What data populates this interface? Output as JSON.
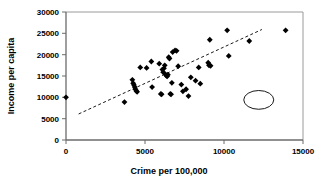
{
  "chart_data": {
    "type": "scatter",
    "title": "",
    "xlabel": "Crime per 100,000",
    "ylabel": "Income per capita",
    "xlim": [
      0,
      15000
    ],
    "ylim": [
      0,
      30000
    ],
    "xticks": [
      0,
      5000,
      10000,
      15000
    ],
    "yticks": [
      0,
      5000,
      10000,
      15000,
      20000,
      25000,
      30000
    ],
    "xtick_labels": [
      "0",
      "5000",
      "10000",
      "15000"
    ],
    "ytick_labels": [
      "0",
      "5000",
      "10000",
      "15000",
      "20000",
      "25000",
      "30000"
    ],
    "grid": false,
    "legend": null,
    "marker": "diamond",
    "marker_color": "#000000",
    "frame_color": "#808080",
    "points": [
      [
        0,
        10000
      ],
      [
        3700,
        8900
      ],
      [
        4200,
        14100
      ],
      [
        4250,
        13300
      ],
      [
        4300,
        12900
      ],
      [
        4350,
        12400
      ],
      [
        4400,
        11900
      ],
      [
        4450,
        11500
      ],
      [
        4500,
        11300
      ],
      [
        4700,
        17000
      ],
      [
        5100,
        16900
      ],
      [
        5400,
        18400
      ],
      [
        5450,
        12400
      ],
      [
        5900,
        17900
      ],
      [
        6000,
        10800
      ],
      [
        6050,
        10700
      ],
      [
        6100,
        16500
      ],
      [
        6150,
        15900
      ],
      [
        6200,
        16800
      ],
      [
        6250,
        17500
      ],
      [
        6300,
        15400
      ],
      [
        6350,
        15100
      ],
      [
        6400,
        14900
      ],
      [
        6450,
        15300
      ],
      [
        6500,
        19400
      ],
      [
        6550,
        19100
      ],
      [
        6600,
        10800
      ],
      [
        6650,
        10700
      ],
      [
        6700,
        13400
      ],
      [
        6750,
        20600
      ],
      [
        6900,
        21000
      ],
      [
        7000,
        20900
      ],
      [
        7100,
        17300
      ],
      [
        7300,
        13000
      ],
      [
        7400,
        11400
      ],
      [
        7600,
        11900
      ],
      [
        7750,
        10300
      ],
      [
        7900,
        14700
      ],
      [
        8200,
        13900
      ],
      [
        8400,
        17000
      ],
      [
        8500,
        13200
      ],
      [
        9000,
        18100
      ],
      [
        9050,
        17500
      ],
      [
        9100,
        23500
      ],
      [
        9150,
        17400
      ],
      [
        10200,
        25700
      ],
      [
        10300,
        19700
      ],
      [
        11600,
        23200
      ],
      [
        13900,
        25700
      ]
    ],
    "trendline": {
      "type": "dashed-linear",
      "x1": 800,
      "y1": 6100,
      "x2": 12400,
      "y2": 25900
    },
    "annotations": [
      {
        "type": "ellipse",
        "name": "outlier-circle",
        "center_x": 12200,
        "center_y": 9400,
        "radius_x": 950,
        "radius_y": 2200,
        "encircled_point": [
          12200,
          9400
        ]
      }
    ]
  }
}
